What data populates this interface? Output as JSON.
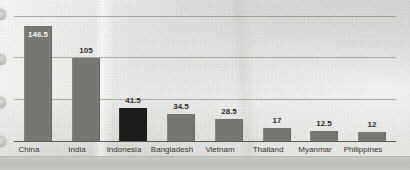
{
  "chart_data": {
    "type": "bar",
    "title": "",
    "subtitle": "",
    "xlabel": "",
    "ylabel": "",
    "ylim": [
      0,
      160
    ],
    "grid": true,
    "gridlines": [
      160,
      110,
      55
    ],
    "legend": "none",
    "categories": [
      "China",
      "India",
      "Indonesia",
      "Bangladesh",
      "Vietnam",
      "Thailand",
      "Myanmar",
      "Philippines"
    ],
    "values": [
      146.5,
      105,
      41.5,
      34.5,
      28.5,
      17,
      12.5,
      12
    ],
    "value_labels": [
      "146.5",
      "105",
      "41.5",
      "34.5",
      "28.5",
      "17",
      "12.5",
      "12"
    ],
    "highlighted_category": "Indonesia",
    "label_placement": [
      "inside",
      "above",
      "above",
      "above",
      "above",
      "above",
      "above",
      "above"
    ],
    "colors": {
      "bar": "#767672",
      "bar_highlight": "#1c1c1a",
      "gridline": "#767670",
      "axis": "#5a5a56",
      "label_text": "#2b2b28",
      "inside_label_text": "#f2f2f0",
      "background": "#e9e9e6",
      "page_edge": "#c2c2bf"
    }
  },
  "page": {
    "media": "scanned-paper",
    "punch_holes": 4
  }
}
